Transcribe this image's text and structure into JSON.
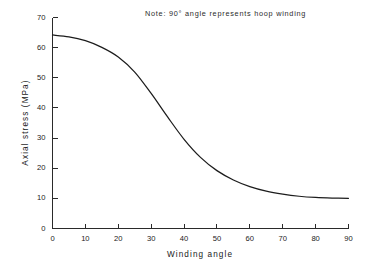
{
  "chart_data": {
    "type": "line",
    "title": "",
    "xlabel": "Winding angle",
    "ylabel": "Axial stress  (MPa)",
    "xlim": [
      0,
      90
    ],
    "ylim": [
      0,
      70
    ],
    "xticks": [
      0,
      10,
      20,
      30,
      40,
      50,
      60,
      70,
      80,
      90
    ],
    "yticks": [
      0,
      10,
      20,
      30,
      40,
      50,
      60,
      70
    ],
    "grid": false,
    "legend": false,
    "annotations": [
      {
        "text": "Note:  90° angle represents  hoop  winding",
        "x": 30,
        "y": 69
      }
    ],
    "series": [
      {
        "name": "Axial stress",
        "x": [
          0,
          5,
          10,
          15,
          20,
          25,
          30,
          35,
          40,
          45,
          50,
          55,
          60,
          65,
          70,
          75,
          80,
          85,
          90
        ],
        "values": [
          64.2,
          63.6,
          62.3,
          60.1,
          56.9,
          51.9,
          44.8,
          37.0,
          29.6,
          23.6,
          19.2,
          16.1,
          13.9,
          12.4,
          11.4,
          10.7,
          10.3,
          10.1,
          10.0
        ]
      }
    ],
    "curve_color": "#1c1c1c",
    "axis_color": "#2a2a2a",
    "background_color": "#ffffff"
  },
  "axis": {
    "x_tick_labels": [
      "0",
      "10",
      "20",
      "30",
      "40",
      "50",
      "60",
      "70",
      "80",
      "90"
    ],
    "y_tick_labels": [
      "0",
      "10",
      "20",
      "30",
      "40",
      "50",
      "60",
      "70"
    ],
    "x_title": "Winding angle",
    "y_title": "Axial stress  (MPa)"
  },
  "note": {
    "text": "Note:  90° angle represents  hoop  winding"
  }
}
